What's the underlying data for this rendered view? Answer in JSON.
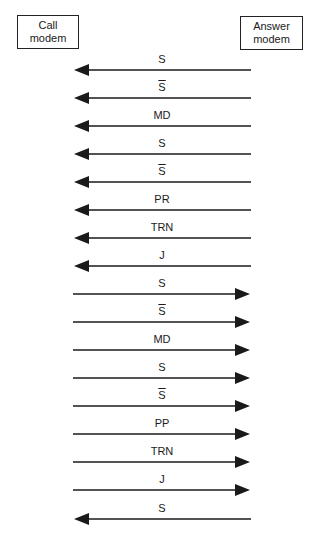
{
  "nodes": {
    "call": {
      "line1": "Call",
      "line2": "modem"
    },
    "answer": {
      "line1": "Answer",
      "line2": "modem"
    }
  },
  "messages": [
    {
      "label": "S",
      "overline": false,
      "direction": "left",
      "y": 70
    },
    {
      "label": "S",
      "overline": true,
      "direction": "left",
      "y": 98
    },
    {
      "label": "MD",
      "overline": false,
      "direction": "left",
      "y": 126
    },
    {
      "label": "S",
      "overline": false,
      "direction": "left",
      "y": 154
    },
    {
      "label": "S",
      "overline": true,
      "direction": "left",
      "y": 182
    },
    {
      "label": "PR",
      "overline": false,
      "direction": "left",
      "y": 210
    },
    {
      "label": "TRN",
      "overline": false,
      "direction": "left",
      "y": 238
    },
    {
      "label": "J",
      "overline": false,
      "direction": "left",
      "y": 266
    },
    {
      "label": "S",
      "overline": false,
      "direction": "right",
      "y": 294
    },
    {
      "label": "S",
      "overline": true,
      "direction": "right",
      "y": 322
    },
    {
      "label": "MD",
      "overline": false,
      "direction": "right",
      "y": 350
    },
    {
      "label": "S",
      "overline": false,
      "direction": "right",
      "y": 378
    },
    {
      "label": "S",
      "overline": true,
      "direction": "right",
      "y": 406
    },
    {
      "label": "PP",
      "overline": false,
      "direction": "right",
      "y": 434
    },
    {
      "label": "TRN",
      "overline": false,
      "direction": "right",
      "y": 462
    },
    {
      "label": "J",
      "overline": false,
      "direction": "right",
      "y": 490
    },
    {
      "label": "S",
      "overline": false,
      "direction": "left",
      "y": 519
    }
  ],
  "style": {
    "line_color": "#1a1a1a",
    "x_left": 74,
    "x_right": 251
  }
}
